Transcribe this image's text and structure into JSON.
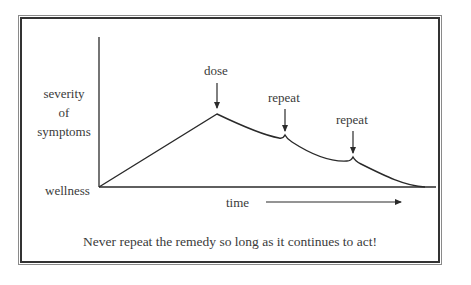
{
  "diagram": {
    "title": "Never repeat the remedy so long as it continues to act!",
    "y_axis_label": [
      "severity",
      "of",
      "symptoms"
    ],
    "baseline_label": "wellness",
    "x_axis_label": "time",
    "annotations": [
      {
        "label": "dose",
        "x": 217,
        "y": 114
      },
      {
        "label": "repeat",
        "x": 285,
        "y": 140
      },
      {
        "label": "repeat",
        "x": 353,
        "y": 163
      }
    ],
    "colors": {
      "line": "#2a2a2a",
      "frame_outer": "#8a8a8a",
      "frame_inner": "#333333"
    }
  }
}
